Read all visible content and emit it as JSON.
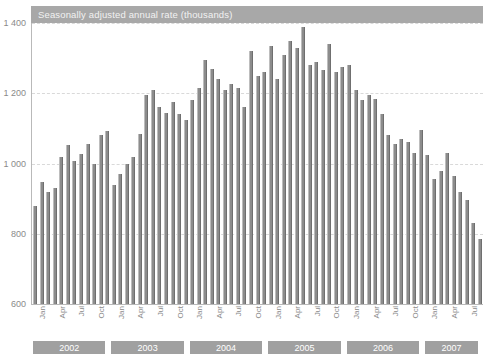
{
  "title": "Seasonally adjusted annual rate (thousands)",
  "colors": {
    "bar": "#8c8c8c",
    "band": "#a0a0a0",
    "title_band": "#a8a8a8",
    "axis": "#b9b9b9",
    "grid": "#d9d9d9",
    "tick_text": "#8a8a8a"
  },
  "axis": {
    "y_ticks": [
      "1 400",
      "1 200",
      "1 000",
      "800",
      "600"
    ],
    "y_values": [
      1400,
      1200,
      1000,
      800,
      600
    ],
    "month_ticks": [
      "Jan",
      "Apr",
      "Jul",
      "Oct"
    ]
  },
  "year_bands": [
    {
      "label": "2002",
      "start_index": 0,
      "count": 12
    },
    {
      "label": "2003",
      "start_index": 12,
      "count": 12
    },
    {
      "label": "2004",
      "start_index": 24,
      "count": 12
    },
    {
      "label": "2005",
      "start_index": 36,
      "count": 12
    },
    {
      "label": "2006",
      "start_index": 48,
      "count": 12
    },
    {
      "label": "2007",
      "start_index": 60,
      "count": 9
    }
  ],
  "chart_data": {
    "type": "bar",
    "title": "Seasonally adjusted annual rate (thousands)",
    "xlabel": "",
    "ylabel": "",
    "ylim": [
      600,
      1400
    ],
    "grid": true,
    "legend": "none",
    "categories": [
      "Jan 2002",
      "Feb 2002",
      "Mar 2002",
      "Apr 2002",
      "May 2002",
      "Jun 2002",
      "Jul 2002",
      "Aug 2002",
      "Sep 2002",
      "Oct 2002",
      "Nov 2002",
      "Dec 2002",
      "Jan 2003",
      "Feb 2003",
      "Mar 2003",
      "Apr 2003",
      "May 2003",
      "Jun 2003",
      "Jul 2003",
      "Aug 2003",
      "Sep 2003",
      "Oct 2003",
      "Nov 2003",
      "Dec 2003",
      "Jan 2004",
      "Feb 2004",
      "Mar 2004",
      "Apr 2004",
      "May 2004",
      "Jun 2004",
      "Jul 2004",
      "Aug 2004",
      "Sep 2004",
      "Oct 2004",
      "Nov 2004",
      "Dec 2004",
      "Jan 2005",
      "Feb 2005",
      "Mar 2005",
      "Apr 2005",
      "May 2005",
      "Jun 2005",
      "Jul 2005",
      "Aug 2005",
      "Sep 2005",
      "Oct 2005",
      "Nov 2005",
      "Dec 2005",
      "Jan 2006",
      "Feb 2006",
      "Mar 2006",
      "Apr 2006",
      "May 2006",
      "Jun 2006",
      "Jul 2006",
      "Aug 2006",
      "Sep 2006",
      "Oct 2006",
      "Nov 2006",
      "Dec 2006",
      "Jan 2007",
      "Feb 2007",
      "Mar 2007",
      "Apr 2007",
      "May 2007",
      "Jun 2007",
      "Jul 2007",
      "Aug 2007",
      "Sep 2007"
    ],
    "values": [
      878,
      948,
      920,
      930,
      1018,
      1052,
      1008,
      1028,
      1056,
      1000,
      1080,
      1092,
      938,
      970,
      1000,
      1018,
      1085,
      1195,
      1208,
      1160,
      1145,
      1175,
      1140,
      1125,
      1180,
      1215,
      1295,
      1270,
      1240,
      1210,
      1225,
      1215,
      1160,
      1320,
      1250,
      1260,
      1335,
      1240,
      1310,
      1350,
      1330,
      1390,
      1280,
      1290,
      1265,
      1340,
      1260,
      1275,
      1280,
      1210,
      1180,
      1195,
      1185,
      1140,
      1080,
      1055,
      1070,
      1060,
      1030,
      1095,
      1025,
      955,
      980,
      1030,
      965,
      920,
      895,
      830,
      785
    ],
    "peak": {
      "category": "Jun 2005",
      "value": 1390
    },
    "first": {
      "category": "Jan 2002",
      "value": 878
    },
    "last": {
      "category": "Sep 2007",
      "value": 785
    }
  }
}
